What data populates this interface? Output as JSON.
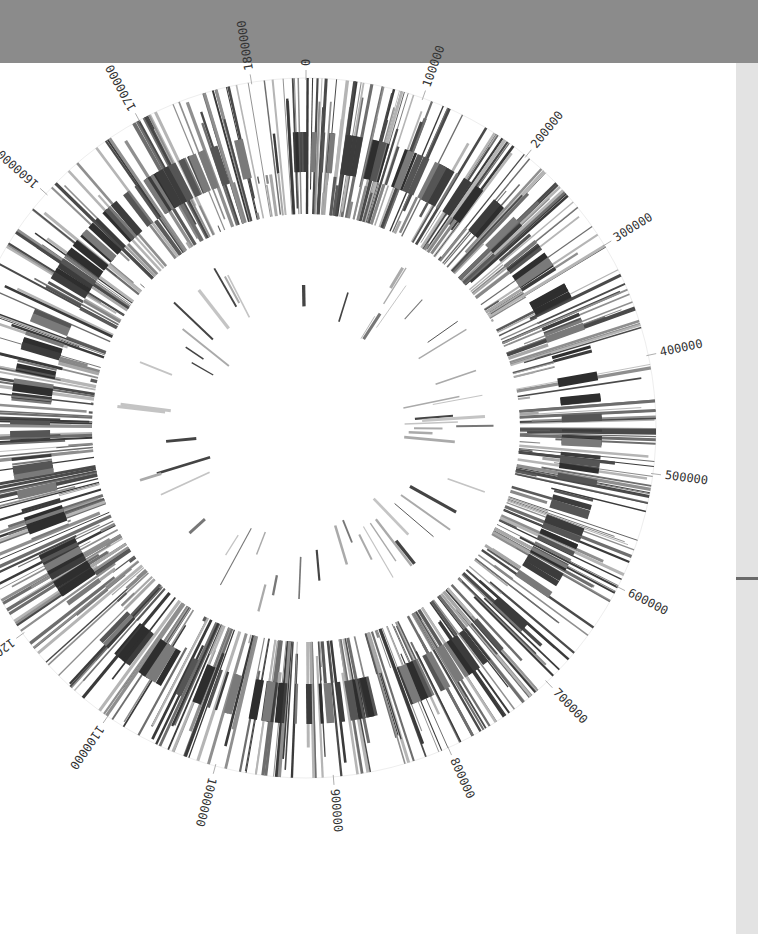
{
  "page": {
    "background": "#ffffff",
    "top_band_color": "#8b8b8b",
    "right_strip_color": "#e3e3e3"
  },
  "genome_map": {
    "type": "circular-genome",
    "center": [
      306,
      428
    ],
    "genome_length": 1846000,
    "tick_interval": 100000,
    "tick_labels": [
      "0",
      "100000",
      "200000",
      "300000",
      "400000",
      "500000",
      "600000",
      "700000",
      "800000",
      "900000",
      "1000000",
      "1100000",
      "1200000",
      "1300000",
      "1400000",
      "1500000",
      "1600000",
      "1700000",
      "1800000"
    ],
    "label_radius": 362,
    "outer_guide_radius": 350,
    "tracks": [
      {
        "name": "forward-features",
        "r_inner": 214,
        "r_outer": 350,
        "count": 420,
        "colors": [
          "#4a4a4a",
          "#6e6e6e",
          "#8f8f8f",
          "#b5b5b5",
          "#3a3a3a"
        ],
        "seed": 11
      },
      {
        "name": "dense-blocks",
        "r_inner": 256,
        "r_outer": 296,
        "count": 260,
        "colors": [
          "#2e2e2e",
          "#3c3c3c",
          "#555555",
          "#7a7a7a"
        ],
        "seed": 23,
        "wide": true
      },
      {
        "name": "reverse-features",
        "r_inner": 214,
        "r_outer": 256,
        "count": 180,
        "colors": [
          "#5a5a5a",
          "#888888",
          "#a8a8a8"
        ],
        "seed": 37
      },
      {
        "name": "inner-sparse",
        "r_inner": 95,
        "r_outer": 190,
        "count": 55,
        "colors": [
          "#444444",
          "#777777",
          "#aaaaaa",
          "#c4c4c4"
        ],
        "seed": 53,
        "sparse": true
      }
    ]
  }
}
